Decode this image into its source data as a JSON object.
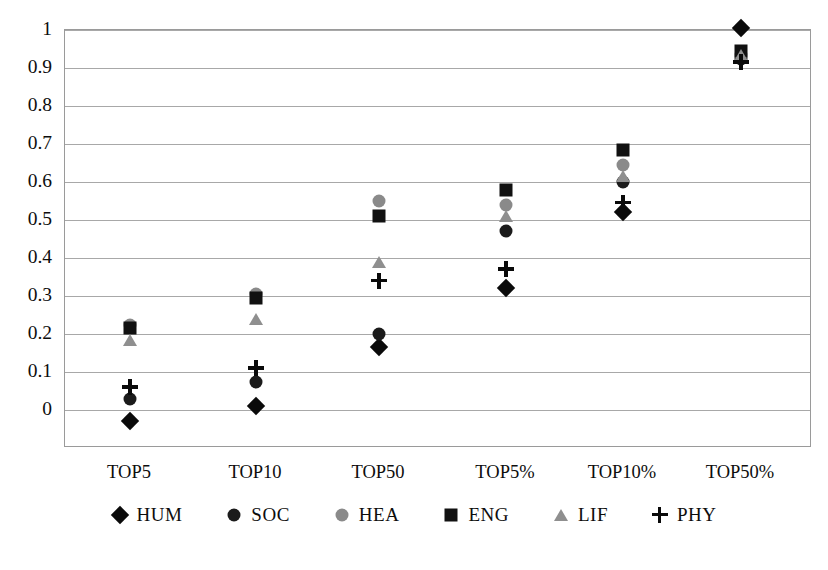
{
  "chart_data": {
    "type": "scatter",
    "title": "",
    "xlabel": "",
    "ylabel": "",
    "grid": true,
    "legend_position": "bottom",
    "ylim": [
      -0.1,
      1.0
    ],
    "yticks": [
      "1",
      "0.9",
      "0.8",
      "0.7",
      "0.6",
      "0.5",
      "0.4",
      "0.3",
      "0.2",
      "0.1",
      "0"
    ],
    "ytick_values": [
      1,
      0.9,
      0.8,
      0.7,
      0.6,
      0.5,
      0.4,
      0.3,
      0.2,
      0.1,
      0
    ],
    "categories": [
      "TOP5",
      "TOP10",
      "TOP50",
      "TOP5%",
      "TOP10%",
      "TOP50%"
    ],
    "series": [
      {
        "name": "HUM",
        "marker": "diamond",
        "color": "#0a0a0a",
        "values": [
          -0.03,
          0.01,
          0.165,
          0.32,
          0.52,
          1.005
        ]
      },
      {
        "name": "SOC",
        "marker": "circle-dark",
        "color": "#1b1b1b",
        "values": [
          0.03,
          0.075,
          0.2,
          0.47,
          0.6,
          0.925
        ]
      },
      {
        "name": "HEA",
        "marker": "circle-gray",
        "color": "#8a8a8a",
        "values": [
          0.225,
          0.305,
          0.55,
          0.54,
          0.645,
          0.935
        ]
      },
      {
        "name": "ENG",
        "marker": "square",
        "color": "#111111",
        "values": [
          0.215,
          0.295,
          0.51,
          0.58,
          0.685,
          0.945
        ]
      },
      {
        "name": "LIF",
        "marker": "triangle",
        "color": "#8f8f8f",
        "values": [
          0.185,
          0.24,
          0.39,
          0.51,
          0.615,
          0.935
        ]
      },
      {
        "name": "PHY",
        "marker": "plus",
        "color": "#0a0a0a",
        "values": [
          0.06,
          0.11,
          0.34,
          0.37,
          0.545,
          0.915
        ]
      }
    ]
  },
  "legend": {
    "items": [
      {
        "label": "HUM",
        "marker": "diamond"
      },
      {
        "label": "SOC",
        "marker": "circle-dark"
      },
      {
        "label": "HEA",
        "marker": "circle-gray"
      },
      {
        "label": "ENG",
        "marker": "square"
      },
      {
        "label": "LIF",
        "marker": "triangle"
      },
      {
        "label": "PHY",
        "marker": "plus"
      }
    ]
  }
}
